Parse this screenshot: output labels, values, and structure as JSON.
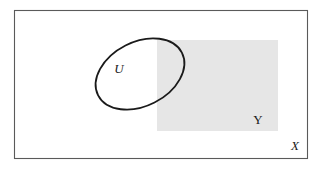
{
  "figure": {
    "type": "set-diagram",
    "width": 323,
    "height": 171,
    "background_color": "#ffffff"
  },
  "elements": {
    "ambient_set": {
      "label": "X",
      "shape": "rectangle",
      "label_style": "italic",
      "stroke_color": "#5a5a5a",
      "stroke_width": 1.1,
      "fill_color": "none",
      "x": 14.5,
      "y": 10.5,
      "width": 293,
      "height": 148,
      "label_x": 295,
      "label_y": 147,
      "label_font_size": 13
    },
    "shaded_set": {
      "label": "Y",
      "shape": "rectangle",
      "label_style": "roman",
      "stroke_color": "none",
      "fill_color": "#e6e6e6",
      "x": 157,
      "y": 40,
      "width": 121,
      "height": 91,
      "label_x": 258,
      "label_y": 121,
      "label_font_size": 13
    },
    "open_set": {
      "label": "U",
      "shape": "ellipse",
      "label_style": "italic",
      "stroke_color": "#1a1a1a",
      "stroke_width": 1.8,
      "fill_color": "none",
      "cx": 140,
      "cy": 74,
      "rx": 47,
      "ry": 32,
      "rotation_deg": -27,
      "label_x": 119,
      "label_y": 70,
      "label_font_size": 13
    }
  },
  "colors": {
    "shaded_fill": "#e6e6e6",
    "outline_dark": "#1a1a1a",
    "outline_gray": "#5a5a5a",
    "background": "#ffffff"
  }
}
